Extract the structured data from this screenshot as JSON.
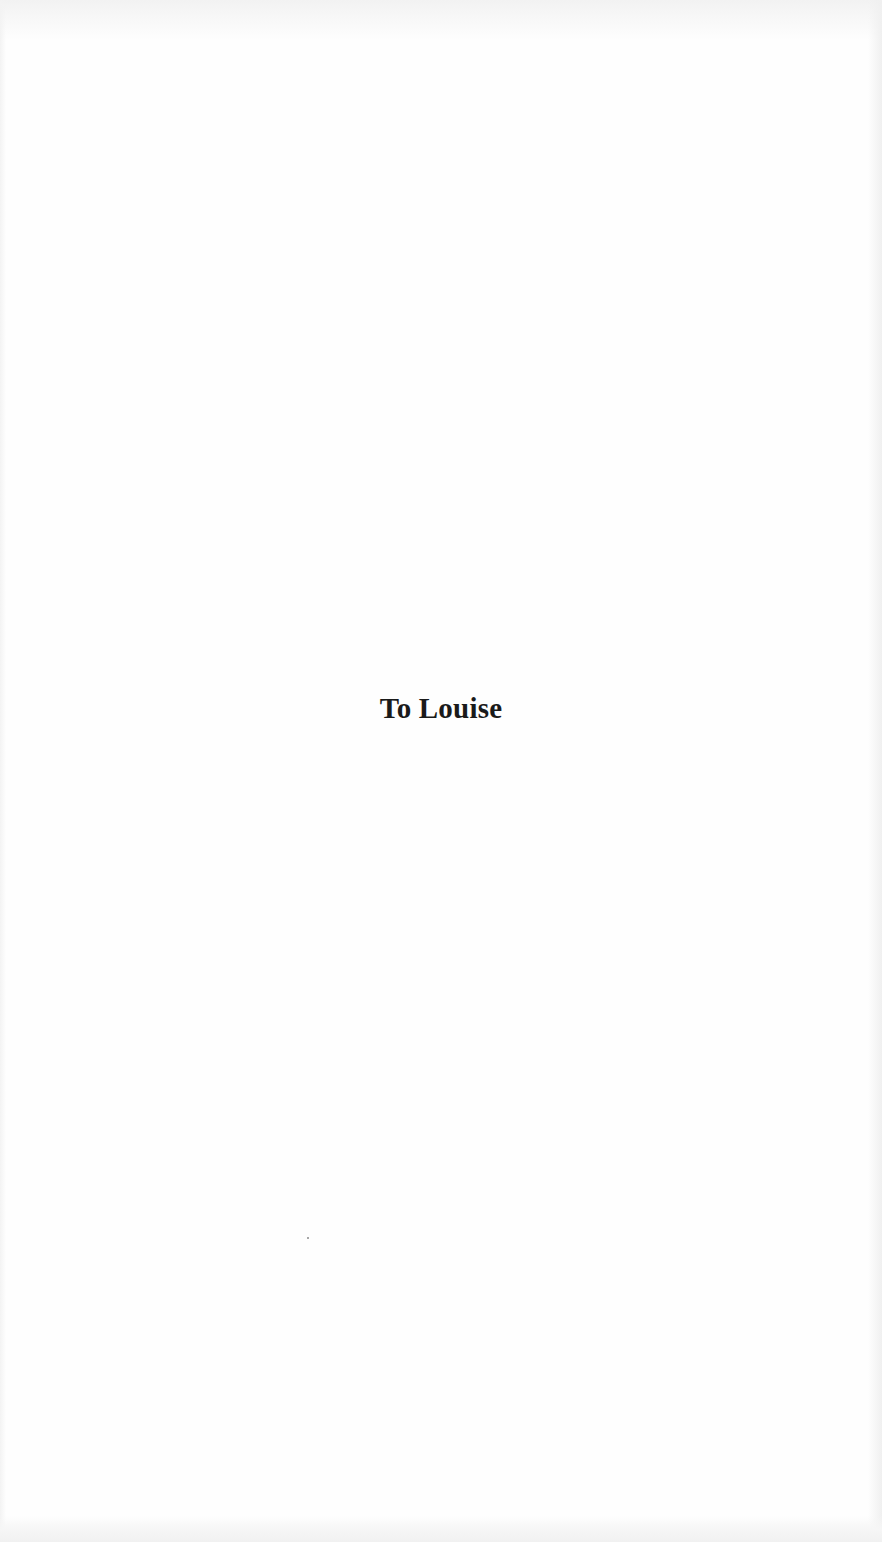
{
  "page": {
    "type": "dedication",
    "dedication_text": "To Louise",
    "background_color": "#fefefe",
    "text_color": "#1a1a1a"
  }
}
